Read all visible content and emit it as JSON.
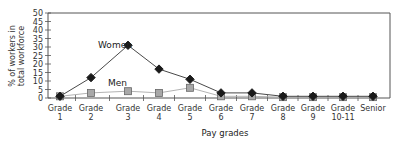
{
  "chart_data": {
    "type": "line",
    "title": "",
    "xlabel": "Pay grades",
    "ylabel": "% of workers in total workforce",
    "ylabel_lines": [
      "% of workers in",
      "total workforce"
    ],
    "ylim": [
      0,
      50
    ],
    "yticks": [
      0,
      5,
      10,
      15,
      20,
      25,
      30,
      35,
      40,
      45,
      50
    ],
    "grid": false,
    "legend_position": "inline labels",
    "categories": [
      [
        "Grade",
        "1"
      ],
      [
        "Grade",
        "2"
      ],
      [
        "Grade",
        "3"
      ],
      [
        "Grade",
        "4"
      ],
      [
        "Grade",
        "5"
      ],
      [
        "Grade",
        "6"
      ],
      [
        "Grade",
        "7"
      ],
      [
        "Grade",
        "8"
      ],
      [
        "Grade",
        "9"
      ],
      [
        "Grade",
        "10-11"
      ],
      [
        "Senior",
        ""
      ]
    ],
    "series": [
      {
        "name": "Women",
        "marker": "diamond",
        "color": "#222222",
        "values": [
          1,
          12,
          31,
          17,
          11,
          3,
          3,
          1,
          1,
          1,
          1
        ]
      },
      {
        "name": "Men",
        "marker": "square",
        "color": "#999999",
        "values": [
          1,
          3,
          4,
          3,
          6,
          1,
          1,
          0.5,
          0.5,
          0.5,
          0.5
        ]
      }
    ],
    "annotations": [
      {
        "text": "Women",
        "near": "Grade 3"
      },
      {
        "text": "Men",
        "near": "Grade 3"
      }
    ]
  }
}
